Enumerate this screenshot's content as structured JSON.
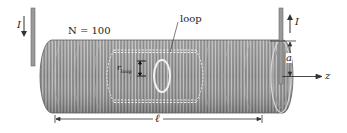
{
  "diagram": {
    "labels": {
      "current_left": "I",
      "current_right": "I",
      "turns": "N = 100",
      "loop": "loop",
      "loop_radius": "r",
      "loop_radius_sub": "loop",
      "radius": "a",
      "axis": "z",
      "length": "ℓ"
    },
    "colors": {
      "coil": "#8a8a8a",
      "coil_dark": "#5e5e5e",
      "coil_light": "#c9c9c9",
      "wire": "#9a9a9a",
      "line": "#333333"
    }
  }
}
